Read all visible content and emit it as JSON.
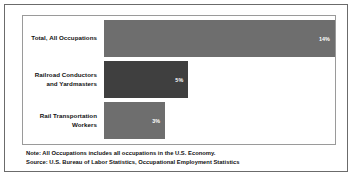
{
  "chart_data": {
    "type": "bar",
    "orientation": "horizontal",
    "title": "",
    "xlabel": "",
    "ylabel": "",
    "grid": false,
    "legend": null,
    "xlim": [
      0,
      16
    ],
    "categories": [
      "Total, All Occupations",
      "Railroad Conductors and Yardmasters",
      "Rail Transportation Workers"
    ],
    "values": [
      14,
      5,
      3
    ],
    "value_labels": [
      "14%",
      "5%",
      "3%"
    ],
    "bars": [
      {
        "label_line1": "Total, All Occupations",
        "label_line2": "",
        "value": 14,
        "value_label": "14%",
        "color": "#6e6e6e",
        "width_pct": 100
      },
      {
        "label_line1": "Railroad Conductors",
        "label_line2": "and Yardmasters",
        "value": 5,
        "value_label": "5%",
        "color": "#3f3f3f",
        "width_pct": 36.5
      },
      {
        "label_line1": "Rail Transportation",
        "label_line2": "Workers",
        "value": 3,
        "value_label": "3%",
        "color": "#6e6e6e",
        "width_pct": 26.5
      }
    ]
  },
  "footer": {
    "note": "Note: All Occupations includes all occupations in the U.S. Economy.",
    "source": "Source: U.S. Bureau of Labor Statistics, Occupational Employment Statistics"
  },
  "colors": {
    "bar_light": "#6e6e6e",
    "bar_dark": "#3f3f3f",
    "outer_border": "#6b6b6b",
    "plot_border": "#9a9a9a",
    "text": "#111111",
    "value_text": "#ffffff",
    "background": "#ffffff"
  }
}
